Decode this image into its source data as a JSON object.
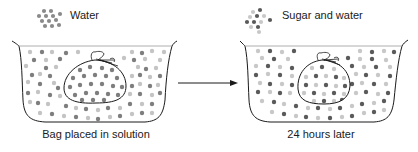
{
  "legend": {
    "water": {
      "label": "Water",
      "dot_color": "#8a8a8a"
    },
    "sugar_and_water": {
      "label": "Sugar and water",
      "sugar_dot_color": "#5a5a5a",
      "water_dot_color": "#c8c8c8"
    }
  },
  "panels": [
    {
      "caption": "Bag placed in solution"
    },
    {
      "caption": "24 hours later"
    }
  ],
  "colors": {
    "outline": "#1a1a1a",
    "water_dot": "#bdbdbd",
    "dark_dot": "#6e6e6e",
    "arrow": "#1a1a1a"
  }
}
